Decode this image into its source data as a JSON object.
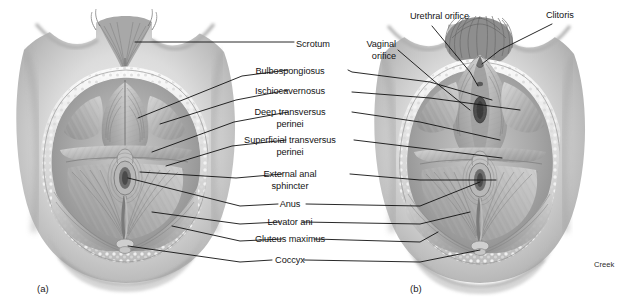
{
  "figure": {
    "background_color": "#ffffff",
    "line_color": "#111111",
    "text_color": "#141414",
    "width": 639,
    "height": 308
  },
  "panels": [
    {
      "id": "panel-a",
      "label": "(a)",
      "subject": "male perineum",
      "x": 37,
      "y": 283
    },
    {
      "id": "panel-b",
      "label": "(b)",
      "subject": "female perineum",
      "x": 410,
      "y": 283
    }
  ],
  "signature": {
    "text": "Creek",
    "x": 594,
    "y": 260
  },
  "center_labels": [
    {
      "name": "scrotum",
      "lines": [
        "Scrotum"
      ],
      "x": 296,
      "y": 45,
      "align": "left",
      "targets": [
        "left"
      ]
    },
    {
      "name": "bulbospongiosus",
      "lines": [
        "Bulbospongiosus"
      ],
      "x": 290,
      "y": 72,
      "align": "center",
      "targets": [
        "left",
        "right"
      ]
    },
    {
      "name": "ischiocavernosus",
      "lines": [
        "Ischiocavernosus"
      ],
      "x": 290,
      "y": 92,
      "align": "center",
      "targets": [
        "left",
        "right"
      ]
    },
    {
      "name": "deep-transversus-perinei",
      "lines": [
        "Deep transversus",
        "perinei"
      ],
      "x": 290,
      "y": 113,
      "align": "center",
      "targets": [
        "left",
        "right"
      ]
    },
    {
      "name": "superficial-transversus-perinei",
      "lines": [
        "Superficial transversus",
        "perinei"
      ],
      "x": 290,
      "y": 141,
      "align": "center",
      "targets": [
        "left",
        "right"
      ]
    },
    {
      "name": "external-anal-sphincter",
      "lines": [
        "External anal",
        "sphincter"
      ],
      "x": 290,
      "y": 175,
      "align": "center",
      "targets": [
        "left",
        "right"
      ]
    },
    {
      "name": "anus",
      "lines": [
        "Anus"
      ],
      "x": 290,
      "y": 205,
      "align": "center",
      "targets": [
        "left",
        "right"
      ]
    },
    {
      "name": "levator-ani",
      "lines": [
        "Levator ani"
      ],
      "x": 290,
      "y": 223,
      "align": "center",
      "targets": [
        "left",
        "right"
      ]
    },
    {
      "name": "gluteus-maximus",
      "lines": [
        "Gluteus maximus"
      ],
      "x": 290,
      "y": 240,
      "align": "center",
      "targets": [
        "left",
        "right"
      ]
    },
    {
      "name": "coccyx",
      "lines": [
        "Coccyx"
      ],
      "x": 290,
      "y": 261,
      "align": "center",
      "targets": [
        "left",
        "right"
      ]
    }
  ],
  "right_labels": [
    {
      "name": "urethral-orifice",
      "lines": [
        "Urethral orifice"
      ],
      "x": 410,
      "y": 17,
      "align": "left"
    },
    {
      "name": "clitoris",
      "lines": [
        "Clitoris"
      ],
      "x": 546,
      "y": 16,
      "align": "left"
    },
    {
      "name": "vaginal-orifice",
      "lines": [
        "Vaginal",
        "orifice"
      ],
      "x": 393,
      "y": 45,
      "align": "right"
    }
  ]
}
